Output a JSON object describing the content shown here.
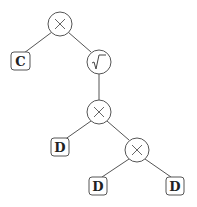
{
  "diagram": {
    "type": "expression-tree",
    "nodes": [
      {
        "id": "n1",
        "kind": "operator",
        "symbol": "×",
        "name": "multiply",
        "cx": 60,
        "cy": 24
      },
      {
        "id": "n2",
        "kind": "leaf",
        "label": "C",
        "x": 11,
        "y": 52
      },
      {
        "id": "n3",
        "kind": "operator",
        "symbol": "√‾",
        "name": "sqrt",
        "cx": 99,
        "cy": 62
      },
      {
        "id": "n4",
        "kind": "operator",
        "symbol": "×",
        "name": "multiply",
        "cx": 99,
        "cy": 112
      },
      {
        "id": "n5",
        "kind": "leaf",
        "label": "D",
        "x": 51,
        "y": 138
      },
      {
        "id": "n6",
        "kind": "operator",
        "symbol": "×",
        "name": "multiply",
        "cx": 137,
        "cy": 150
      },
      {
        "id": "n7",
        "kind": "leaf",
        "label": "D",
        "x": 89,
        "y": 176
      },
      {
        "id": "n8",
        "kind": "leaf",
        "label": "D",
        "x": 166,
        "y": 176
      }
    ],
    "edges": [
      [
        "n1",
        "n2"
      ],
      [
        "n1",
        "n3"
      ],
      [
        "n3",
        "n4"
      ],
      [
        "n4",
        "n5"
      ],
      [
        "n4",
        "n6"
      ],
      [
        "n6",
        "n7"
      ],
      [
        "n6",
        "n8"
      ]
    ],
    "labels": {
      "root_op": "×",
      "sqrt_op": "√",
      "mid_op": "×",
      "low_op": "×",
      "leaf_c": "C",
      "leaf_d1": "D",
      "leaf_d2": "D",
      "leaf_d3": "D"
    }
  }
}
